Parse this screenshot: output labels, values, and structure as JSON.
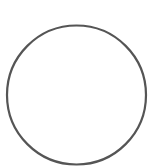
{
  "canvas": {
    "width": 156,
    "height": 166,
    "background": "#ffffff"
  },
  "shape": {
    "type": "circle",
    "cx": 76.5,
    "cy": 95,
    "r": 69.5,
    "stroke": "#555555",
    "stroke_width": 2.2,
    "fill": "none"
  }
}
